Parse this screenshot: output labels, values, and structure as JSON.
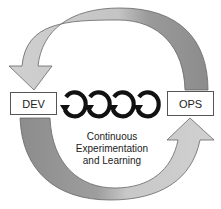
{
  "nodes": {
    "dev": {
      "label": "DEV"
    },
    "ops": {
      "label": "OPS"
    }
  },
  "caption": {
    "line1": "Continuous",
    "line2": "Experimentation",
    "line3": "and Learning"
  },
  "arrows": {
    "top": {
      "from": "OPS",
      "to": "DEV",
      "color_light": "#c8c8c8",
      "color_dark": "#8a8a8a"
    },
    "bottom": {
      "from": "DEV",
      "to": "OPS",
      "color_light": "#c8c8c8",
      "color_dark": "#8a8a8a"
    }
  },
  "loop_icons": {
    "count": 4,
    "icon": "counterclockwise-loop-arrow"
  }
}
